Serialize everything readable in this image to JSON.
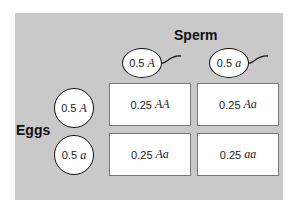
{
  "labels": {
    "sperm": "Sperm",
    "eggs": "Eggs"
  },
  "sperm": [
    {
      "freq": "0.5",
      "allele": "A"
    },
    {
      "freq": "0.5",
      "allele": "a"
    }
  ],
  "eggs": [
    {
      "freq": "0.5",
      "allele": "A"
    },
    {
      "freq": "0.5",
      "allele": "a"
    }
  ],
  "cells": [
    [
      {
        "freq": "0.25",
        "genotype": "AA"
      },
      {
        "freq": "0.25",
        "genotype": "Aa"
      }
    ],
    [
      {
        "freq": "0.25",
        "genotype": "Aa"
      },
      {
        "freq": "0.25",
        "genotype": "aa"
      }
    ]
  ],
  "colors": {
    "panel": "#c9c9c9",
    "box": "#ffffff",
    "outline": "#111111"
  }
}
